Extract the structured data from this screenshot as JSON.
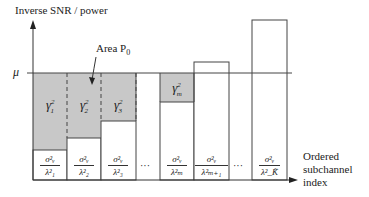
{
  "diagram": {
    "type": "water-filling",
    "y_axis_label": "Inverse SNR / power",
    "x_axis_label_lines": [
      "Ordered",
      "subchannel",
      "index"
    ],
    "water_level_label": "μ",
    "area_annotation": "Area P",
    "area_annotation_sub": "0",
    "ellipsis": "···",
    "colors": {
      "shade": "#c8c8c8",
      "line": "#444444",
      "background": "#ffffff"
    },
    "bars": [
      {
        "id": "1",
        "gamma": "γ",
        "gamma_sub": "1",
        "num": "σ²ᵥ",
        "den": "λ²₁",
        "shaded": true
      },
      {
        "id": "2",
        "gamma": "γ",
        "gamma_sub": "2",
        "num": "σ²ᵥ",
        "den": "λ²₂",
        "shaded": true
      },
      {
        "id": "3",
        "gamma": "γ",
        "gamma_sub": "3",
        "num": "σ²ᵥ",
        "den": "λ²₃",
        "shaded": true
      },
      {
        "id": "m",
        "gamma": "γ",
        "gamma_sub": "m",
        "num": "σ²ᵥ",
        "den": "λ²ₘ",
        "shaded": true
      },
      {
        "id": "m+1",
        "num": "σ²ᵥ",
        "den": "λ²ₘ₊₁",
        "shaded": false
      },
      {
        "id": "K",
        "num": "σ²ᵥ",
        "den": "λ²_K̃",
        "shaded": false
      }
    ]
  }
}
